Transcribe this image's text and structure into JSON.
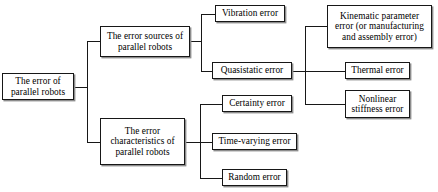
{
  "diagram": {
    "type": "tree-diagram",
    "orientation": "left-to-right",
    "colors": {
      "box_border": "#171717",
      "box_fill": "#ffffff",
      "connector": "#171717",
      "text": "#000000",
      "shadow": "#8d8d8d"
    },
    "nodes": {
      "root": "The error of parallel robots",
      "sources": "The error sources of parallel robots",
      "characteristics": "The error characteristics of parallel robots",
      "vibration": "Vibration error",
      "quasistatic": "Quasistatic error",
      "kinematic": "Kinematic parameter error (or manufacturing and assembly error)",
      "thermal": "Thermal error",
      "nonlinear": "Nonlinear stiffness error",
      "certainty": "Certainty error",
      "time_varying": "Time-varying error",
      "random": "Random error"
    },
    "levels": [
      {
        "level": 1,
        "items": [
          "The error of parallel robots"
        ]
      },
      {
        "level": 2,
        "items": [
          "The error sources of parallel robots",
          "The error characteristics of parallel robots"
        ]
      },
      {
        "level": 3,
        "items": [
          "Vibration error",
          "Quasistatic error",
          "Certainty error",
          "Time-varying error",
          "Random error"
        ]
      },
      {
        "level": 4,
        "items": [
          "Kinematic parameter error (or manufacturing and assembly error)",
          "Thermal error",
          "Nonlinear stiffness error"
        ]
      }
    ],
    "edges": [
      {
        "from": "The error of parallel robots",
        "to": "The error sources of parallel robots"
      },
      {
        "from": "The error of parallel robots",
        "to": "The error characteristics of parallel robots"
      },
      {
        "from": "The error sources of parallel robots",
        "to": "Vibration error"
      },
      {
        "from": "The error sources of parallel robots",
        "to": "Quasistatic error"
      },
      {
        "from": "Quasistatic error",
        "to": "Kinematic parameter error (or manufacturing and assembly error)"
      },
      {
        "from": "Quasistatic error",
        "to": "Thermal error"
      },
      {
        "from": "Quasistatic error",
        "to": "Nonlinear stiffness error"
      },
      {
        "from": "The error characteristics of parallel robots",
        "to": "Certainty error"
      },
      {
        "from": "The error characteristics of parallel robots",
        "to": "Time-varying error"
      },
      {
        "from": "The error characteristics of parallel robots",
        "to": "Random error"
      }
    ]
  }
}
